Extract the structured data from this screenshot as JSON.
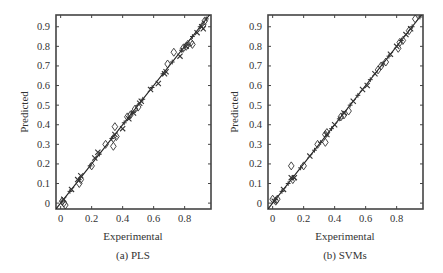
{
  "chart_data": [
    {
      "type": "scatter",
      "title": "",
      "caption": "(a) PLS",
      "xlabel": "Experimental",
      "ylabel": "Predicted",
      "xlim": [
        -0.03,
        0.97
      ],
      "ylim": [
        -0.03,
        0.96
      ],
      "xticks": [
        0,
        0.2,
        0.4,
        0.6,
        0.8
      ],
      "xtick_labels": [
        "0",
        "0.2",
        "0.4",
        "0.6",
        "0.8"
      ],
      "yticks": [
        0,
        0.1,
        0.2,
        0.3,
        0.4,
        0.5,
        0.6,
        0.7,
        0.8,
        0.9
      ],
      "ytick_labels": [
        "0",
        "0.1",
        "0.2",
        "0.3",
        "0.4",
        "0.5",
        "0.6",
        "0.7",
        "0.8",
        "0.9"
      ],
      "grid": false,
      "legend": null,
      "reference_line": {
        "x": [
          -0.03,
          0.97
        ],
        "y": [
          -0.03,
          0.97
        ],
        "label": "y = x"
      },
      "series": [
        {
          "name": "diamond markers",
          "marker": "diamond",
          "x": [
            0.01,
            0.02,
            0.03,
            0.12,
            0.13,
            0.2,
            0.29,
            0.34,
            0.34,
            0.35,
            0.36,
            0.43,
            0.45,
            0.48,
            0.5,
            0.69,
            0.73,
            0.79,
            0.81,
            0.82,
            0.84,
            0.85,
            0.92,
            0.93
          ],
          "y": [
            0.01,
            0.0,
            -0.01,
            0.1,
            0.12,
            0.19,
            0.3,
            0.29,
            0.33,
            0.39,
            0.34,
            0.44,
            0.45,
            0.48,
            0.49,
            0.71,
            0.77,
            0.79,
            0.8,
            0.81,
            0.82,
            0.81,
            0.91,
            0.93
          ]
        },
        {
          "name": "cross markers",
          "marker": "x",
          "x": [
            0.02,
            0.07,
            0.11,
            0.13,
            0.22,
            0.24,
            0.35,
            0.4,
            0.44,
            0.47,
            0.51,
            0.52,
            0.58,
            0.63,
            0.67,
            0.68,
            0.77,
            0.81,
            0.88,
            0.91,
            0.92
          ],
          "y": [
            0.02,
            0.07,
            0.12,
            0.14,
            0.23,
            0.26,
            0.35,
            0.38,
            0.43,
            0.46,
            0.51,
            0.52,
            0.58,
            0.61,
            0.66,
            0.67,
            0.75,
            0.8,
            0.87,
            0.9,
            0.89
          ]
        },
        {
          "name": "plus markers",
          "marker": "plus",
          "x": [
            0.01,
            0.06,
            0.12,
            0.19,
            0.25,
            0.33,
            0.41,
            0.46,
            0.53,
            0.59,
            0.66,
            0.72,
            0.78,
            0.85,
            0.9,
            0.94
          ],
          "y": [
            0.01,
            0.06,
            0.12,
            0.19,
            0.25,
            0.33,
            0.41,
            0.46,
            0.53,
            0.59,
            0.66,
            0.72,
            0.78,
            0.85,
            0.9,
            0.94
          ]
        }
      ]
    },
    {
      "type": "scatter",
      "title": "",
      "caption": "(b) SVMs",
      "xlabel": "Experimental",
      "ylabel": "Predicted",
      "xlim": [
        -0.03,
        0.97
      ],
      "ylim": [
        -0.03,
        0.96
      ],
      "xticks": [
        0,
        0.2,
        0.4,
        0.6,
        0.8
      ],
      "xtick_labels": [
        "0",
        "0.2",
        "0.4",
        "0.6",
        "0.8"
      ],
      "yticks": [
        0,
        0.1,
        0.2,
        0.3,
        0.4,
        0.5,
        0.6,
        0.7,
        0.8,
        0.9
      ],
      "ytick_labels": [
        "0",
        "0.1",
        "0.2",
        "0.3",
        "0.4",
        "0.5",
        "0.6",
        "0.7",
        "0.8",
        "0.9"
      ],
      "grid": false,
      "legend": null,
      "reference_line": {
        "x": [
          -0.03,
          0.97
        ],
        "y": [
          -0.03,
          0.97
        ],
        "label": "y = x"
      },
      "series": [
        {
          "name": "diamond markers",
          "marker": "diamond",
          "x": [
            0.0,
            0.02,
            0.03,
            0.12,
            0.13,
            0.2,
            0.29,
            0.34,
            0.34,
            0.35,
            0.44,
            0.46,
            0.49,
            0.68,
            0.7,
            0.73,
            0.81,
            0.82,
            0.84,
            0.88,
            0.92
          ],
          "y": [
            0.02,
            0.01,
            0.02,
            0.19,
            0.12,
            0.19,
            0.3,
            0.31,
            0.35,
            0.36,
            0.44,
            0.45,
            0.47,
            0.68,
            0.7,
            0.72,
            0.79,
            0.82,
            0.83,
            0.88,
            0.94
          ],
          "x_note": "Values estimated from marker positions"
        },
        {
          "name": "cross markers",
          "marker": "x",
          "x": [
            0.01,
            0.07,
            0.12,
            0.14,
            0.24,
            0.35,
            0.4,
            0.46,
            0.52,
            0.58,
            0.61,
            0.66,
            0.76,
            0.8,
            0.86,
            0.89
          ],
          "y": [
            0.01,
            0.07,
            0.13,
            0.13,
            0.24,
            0.35,
            0.4,
            0.46,
            0.52,
            0.58,
            0.6,
            0.66,
            0.76,
            0.8,
            0.86,
            0.89
          ]
        },
        {
          "name": "plus markers",
          "marker": "plus",
          "x": [
            0.02,
            0.06,
            0.1,
            0.18,
            0.27,
            0.31,
            0.38,
            0.43,
            0.5,
            0.55,
            0.63,
            0.71,
            0.75,
            0.83,
            0.9,
            0.95
          ],
          "y": [
            0.02,
            0.06,
            0.1,
            0.18,
            0.27,
            0.31,
            0.38,
            0.43,
            0.5,
            0.55,
            0.63,
            0.71,
            0.75,
            0.83,
            0.9,
            0.95
          ]
        }
      ]
    }
  ],
  "colors": {
    "axis": "#444444",
    "marker": "#333333",
    "line": "#222222",
    "text": "#333333"
  },
  "panels": [
    {
      "caption": "(a) PLS",
      "xlabel": "Experimental",
      "ylabel": "Predicted"
    },
    {
      "caption": "(b) SVMs",
      "xlabel": "Experimental",
      "ylabel": "Predicted"
    }
  ]
}
